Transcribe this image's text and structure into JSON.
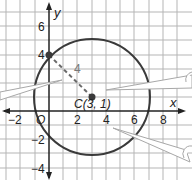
{
  "graph": {
    "x_axis_label": "x",
    "y_axis_label": "y",
    "origin_label": "O",
    "x_ticks": [
      {
        "value": -2,
        "label": "−2"
      },
      {
        "value": 2,
        "label": "2"
      },
      {
        "value": 4,
        "label": "4"
      },
      {
        "value": 6,
        "label": "6"
      },
      {
        "value": 8,
        "label": "8"
      }
    ],
    "y_ticks": [
      {
        "value": 6,
        "label": "6"
      },
      {
        "value": 4,
        "label": "4"
      },
      {
        "value": -2,
        "label": "−2"
      },
      {
        "value": -4,
        "label": "−4"
      }
    ],
    "center_label": "C(3, 1)",
    "radius_label": "4",
    "circle": {
      "cx": 3,
      "cy": 1,
      "r": 5
    },
    "point_on_circle": {
      "x": 0,
      "y": 4
    },
    "colors": {
      "grid": "#b5b5b5",
      "axis": "#222222",
      "circle": "#3a3a3a",
      "dashed_radius": "#6a6a6a",
      "point": "#3a3a3a",
      "callout_fill": "#ffffff",
      "callout_stroke": "#a8a8a8"
    }
  }
}
